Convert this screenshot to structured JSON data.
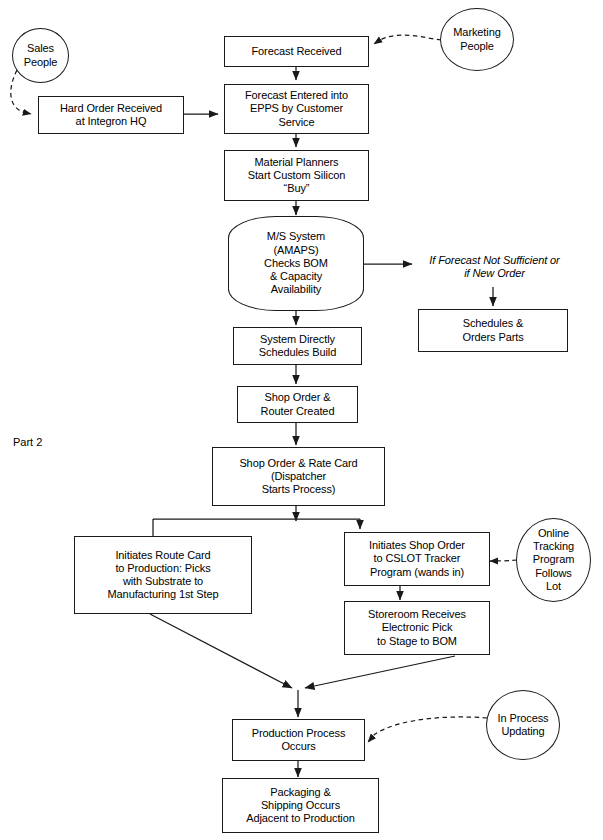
{
  "diagram": {
    "section_label": "Part 2",
    "nodes": [
      {
        "id": "sales-people",
        "shape": "ellipse",
        "text": "Sales\nPeople"
      },
      {
        "id": "marketing-people",
        "shape": "ellipse",
        "text": "Marketing\nPeople"
      },
      {
        "id": "forecast-received",
        "shape": "box",
        "text": "Forecast Received"
      },
      {
        "id": "hard-order-received",
        "shape": "box",
        "text": "Hard Order Received\nat Integron HQ"
      },
      {
        "id": "forecast-entered",
        "shape": "box",
        "text": "Forecast Entered into\nEPPS by Customer\nService"
      },
      {
        "id": "material-planners",
        "shape": "box",
        "text": "Material Planners\nStart  Custom Silicon\n“Buy”"
      },
      {
        "id": "ms-system",
        "shape": "curved",
        "text": "M/S System\n(AMAPS)\nChecks BOM\n& Capacity\nAvailability"
      },
      {
        "id": "forecast-condition",
        "shape": "plain",
        "text": "If Forecast Not Sufficient or\nif New Order"
      },
      {
        "id": "schedules-orders",
        "shape": "box",
        "text": "Schedules &\nOrders Parts"
      },
      {
        "id": "system-schedules",
        "shape": "box",
        "text": "System Directly\nSchedules Build"
      },
      {
        "id": "shop-order-router",
        "shape": "box",
        "text": "Shop Order &\nRouter Created"
      },
      {
        "id": "shop-order-rate",
        "shape": "box",
        "text": "Shop Order & Rate Card\n(Dispatcher\nStarts Process)"
      },
      {
        "id": "route-card",
        "shape": "box",
        "text": "Initiates Route Card\nto Production: Picks\nwith Substrate to\nManufacturing 1st Step"
      },
      {
        "id": "cslot-tracker",
        "shape": "box",
        "text": "Initiates Shop Order\nto CSLOT Tracker\nProgram (wands in)"
      },
      {
        "id": "online-tracking",
        "shape": "ellipse",
        "text": "Online\nTracking\nProgram\nFollows\nLot"
      },
      {
        "id": "storeroom-receives",
        "shape": "box",
        "text": "Storeroom Receives\nElectronic Pick\nto Stage to BOM"
      },
      {
        "id": "production-process",
        "shape": "box",
        "text": "Production Process\nOccurs"
      },
      {
        "id": "in-process-updating",
        "shape": "ellipse",
        "text": "In Process\nUpdating"
      },
      {
        "id": "packaging-shipping",
        "shape": "box",
        "text": "Packaging &\nShipping Occurs\nAdjacent to Production"
      }
    ],
    "colors": {
      "stroke": "#1a1a1a",
      "text": "#000000",
      "fill": "#ffffff"
    }
  }
}
